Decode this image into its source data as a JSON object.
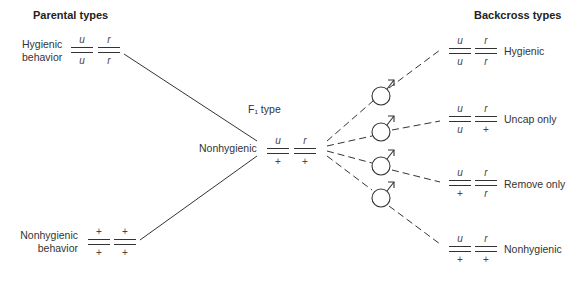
{
  "headings": {
    "parental": "Parental types",
    "backcross": "Backcross types",
    "f1": "F₁ type"
  },
  "parental": [
    {
      "label_line1": "Hygienic",
      "label_line2": "behavior",
      "genotype": {
        "u_top": "u",
        "u_bottom": "u",
        "r_top": "r",
        "r_bottom": "r"
      }
    },
    {
      "label_line1": "Nonhygienic",
      "label_line2": "behavior",
      "genotype": {
        "u_top": "+",
        "u_bottom": "+",
        "r_top": "+",
        "r_bottom": "+"
      }
    }
  ],
  "f1": {
    "label": "Nonhygienic",
    "genotype": {
      "u_top": "u",
      "u_bottom": "+",
      "r_top": "r",
      "r_bottom": "+"
    }
  },
  "backcross": [
    {
      "label": "Hygienic",
      "genotype": {
        "u_top": "u",
        "u_bottom": "u",
        "r_top": "r",
        "r_bottom": "r"
      }
    },
    {
      "label": "Uncap only",
      "genotype": {
        "u_top": "u",
        "u_bottom": "u",
        "r_top": "r",
        "r_bottom": "+"
      }
    },
    {
      "label": "Remove only",
      "genotype": {
        "u_top": "u",
        "u_bottom": "+",
        "r_top": "r",
        "r_bottom": "r"
      }
    },
    {
      "label": "Nonhygienic",
      "genotype": {
        "u_top": "u",
        "u_bottom": "+",
        "r_top": "r",
        "r_bottom": "+"
      }
    }
  ],
  "symbols": {
    "male": "male-symbol",
    "count": 4
  },
  "colors": {
    "line": "#333333",
    "text": "#2a2a2a"
  }
}
